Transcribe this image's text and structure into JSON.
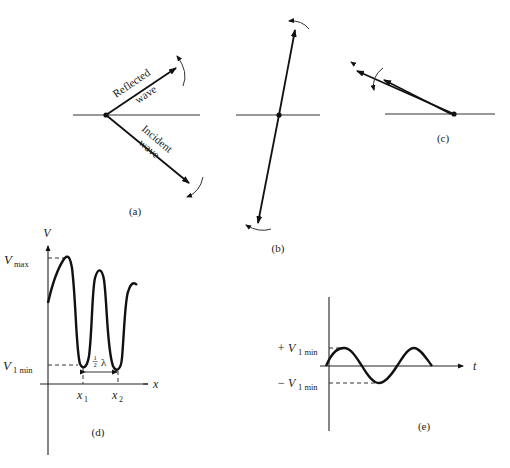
{
  "figure": {
    "panels": {
      "a": {
        "caption": "(a)",
        "reflected_label_1": "Reflected",
        "reflected_label_2": "wave",
        "incident_label_1": "Incident",
        "incident_label_2": "wave"
      },
      "b": {
        "caption": "(b)"
      },
      "c": {
        "caption": "(c)"
      },
      "d": {
        "caption": "(d)",
        "y_axis_label": "V",
        "x_axis_label": "x",
        "vmax_label": "V",
        "vmax_sub": "max",
        "vmin_label": "V",
        "vmin_sub": "1 min",
        "x1_label": "x",
        "x1_sub": "1",
        "x2_label": "x",
        "x2_sub": "2",
        "half_lambda_num": "1",
        "half_lambda_den": "2",
        "lambda": "λ"
      },
      "e": {
        "caption": "(e)",
        "t_label": "t",
        "plus_label": "+ V",
        "plus_sub": "1 min",
        "minus_label": "− V",
        "minus_sub": "1 min"
      }
    }
  }
}
